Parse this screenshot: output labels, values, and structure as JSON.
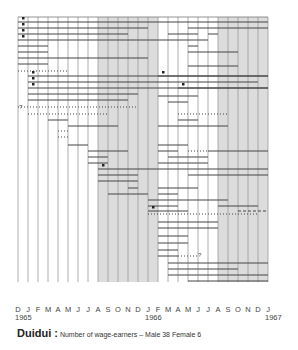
{
  "chart_data": {
    "type": "timeline",
    "title": "Duidui",
    "subtitle": "Number of wage-earners – Male 38   Female 6",
    "caption_name": "Duidui :",
    "caption_text": "Number of wage-earners – Male 38    Female 6",
    "x_ticks": [
      "D",
      "J",
      "F",
      "M",
      "A",
      "M",
      "J",
      "J",
      "A",
      "S",
      "O",
      "N",
      "D",
      "J",
      "F",
      "M",
      "A",
      "M",
      "J",
      "J",
      "A",
      "S",
      "O",
      "N",
      "D",
      "J"
    ],
    "year_labels": [
      {
        "label": "1965",
        "index": 0
      },
      {
        "label": "1966",
        "index": 13
      },
      {
        "label": "1967",
        "index": 25
      }
    ],
    "shaded_ranges": [
      [
        8,
        14
      ],
      [
        20,
        25
      ]
    ],
    "grid": {
      "x0": 18,
      "dx": 10,
      "top": 17,
      "bottom": 282
    },
    "rows": [
      {
        "y": 22,
        "start": 0,
        "end": 25,
        "style": "solid",
        "marker": "dot"
      },
      {
        "y": 28,
        "start": 0,
        "end": 13,
        "style": "solid",
        "marker": "dot"
      },
      {
        "y": 28,
        "start": 17,
        "end": 25,
        "style": "solid"
      },
      {
        "y": 34,
        "start": 0,
        "end": 11,
        "style": "solid",
        "marker": "dot"
      },
      {
        "y": 34,
        "start": 15,
        "end": 18,
        "style": "solid"
      },
      {
        "y": 34,
        "start": 19,
        "end": 20,
        "style": "solid"
      },
      {
        "y": 40,
        "start": 0,
        "end": 19,
        "style": "solid",
        "marker": "dot"
      },
      {
        "y": 46,
        "start": 0,
        "end": 3,
        "style": "solid"
      },
      {
        "y": 46,
        "start": 17,
        "end": 18,
        "style": "solid"
      },
      {
        "y": 52,
        "start": 0,
        "end": 3,
        "style": "solid"
      },
      {
        "y": 52,
        "start": 17,
        "end": 22,
        "style": "solid"
      },
      {
        "y": 58,
        "start": 0,
        "end": 13,
        "style": "solid"
      },
      {
        "y": 64,
        "start": 0,
        "end": 3,
        "style": "solid"
      },
      {
        "y": 66,
        "start": 17,
        "end": 22,
        "style": "solid"
      },
      {
        "y": 71,
        "start": 0,
        "end": 5,
        "style": "dotted"
      },
      {
        "y": 76,
        "start": 1,
        "end": 25,
        "style": "solid",
        "marker": "dot"
      },
      {
        "y": 76,
        "start": 14,
        "end": 25,
        "style": "solid",
        "marker": "dot"
      },
      {
        "y": 82,
        "start": 1,
        "end": 24,
        "style": "solid",
        "marker": "dot"
      },
      {
        "y": 88,
        "start": 1,
        "end": 25,
        "style": "solid",
        "marker": "dot"
      },
      {
        "y": 88,
        "start": 16,
        "end": 25,
        "style": "solid",
        "marker": "dot"
      },
      {
        "y": 94,
        "start": 1,
        "end": 12,
        "style": "solid"
      },
      {
        "y": 96,
        "start": 14,
        "end": 18,
        "style": "solid"
      },
      {
        "y": 100,
        "start": 1,
        "end": 11,
        "style": "solid"
      },
      {
        "y": 102,
        "start": 15,
        "end": 17,
        "style": "solid"
      },
      {
        "y": 107,
        "start": 0,
        "end": 12,
        "style": "dotted",
        "marker": "question"
      },
      {
        "y": 114,
        "start": 1,
        "end": 9,
        "style": "dotted"
      },
      {
        "y": 114,
        "start": 16,
        "end": 21,
        "style": "dotted"
      },
      {
        "y": 120,
        "start": 3,
        "end": 5,
        "style": "solid"
      },
      {
        "y": 120,
        "start": 16,
        "end": 18,
        "style": "solid"
      },
      {
        "y": 126,
        "start": 5,
        "end": 10,
        "style": "solid"
      },
      {
        "y": 126,
        "start": 14,
        "end": 21,
        "style": "solid"
      },
      {
        "y": 131,
        "start": 4,
        "end": 5,
        "style": "dotted"
      },
      {
        "y": 137,
        "start": 4,
        "end": 5,
        "style": "dotted"
      },
      {
        "y": 145,
        "start": 5,
        "end": 7,
        "style": "solid"
      },
      {
        "y": 145,
        "start": 14,
        "end": 17,
        "style": "solid"
      },
      {
        "y": 151,
        "start": 7,
        "end": 11,
        "style": "solid"
      },
      {
        "y": 151,
        "start": 14,
        "end": 16,
        "style": "solid"
      },
      {
        "y": 151,
        "start": 17,
        "end": 19,
        "style": "dotted"
      },
      {
        "y": 151,
        "start": 19,
        "end": 25,
        "style": "solid"
      },
      {
        "y": 157,
        "start": 7,
        "end": 9,
        "style": "solid"
      },
      {
        "y": 157,
        "start": 15,
        "end": 19,
        "style": "solid"
      },
      {
        "y": 163,
        "start": 7,
        "end": 9,
        "style": "solid"
      },
      {
        "y": 163,
        "start": 14,
        "end": 19,
        "style": "solid"
      },
      {
        "y": 169,
        "start": 8,
        "end": 25,
        "style": "solid",
        "marker": "dot"
      },
      {
        "y": 175,
        "start": 8,
        "end": 12,
        "style": "solid"
      },
      {
        "y": 175,
        "start": 17,
        "end": 25,
        "style": "solid"
      },
      {
        "y": 181,
        "start": 8,
        "end": 12,
        "style": "solid"
      },
      {
        "y": 188,
        "start": 11,
        "end": 12,
        "style": "solid"
      },
      {
        "y": 188,
        "start": 14,
        "end": 18,
        "style": "solid"
      },
      {
        "y": 194,
        "start": 9,
        "end": 13,
        "style": "solid"
      },
      {
        "y": 194,
        "start": 14,
        "end": 16,
        "style": "solid"
      },
      {
        "y": 200,
        "start": 13,
        "end": 14,
        "style": "solid"
      },
      {
        "y": 200,
        "start": 14,
        "end": 21,
        "style": "solid"
      },
      {
        "y": 206,
        "start": 13,
        "end": 16,
        "style": "solid"
      },
      {
        "y": 206,
        "start": 20,
        "end": 24,
        "style": "solid"
      },
      {
        "y": 211,
        "start": 13,
        "end": 17,
        "style": "solid",
        "marker": "dot"
      },
      {
        "y": 211,
        "start": 22,
        "end": 25,
        "style": "dashed"
      },
      {
        "y": 214,
        "start": 13,
        "end": 24,
        "style": "dotted"
      },
      {
        "y": 222,
        "start": 14,
        "end": 20,
        "style": "solid"
      },
      {
        "y": 228,
        "start": 14,
        "end": 20,
        "style": "solid"
      },
      {
        "y": 236,
        "start": 14,
        "end": 17,
        "style": "solid"
      },
      {
        "y": 243,
        "start": 14,
        "end": 17,
        "style": "solid"
      },
      {
        "y": 250,
        "start": 14,
        "end": 16,
        "style": "solid"
      },
      {
        "y": 256,
        "start": 14,
        "end": 16,
        "style": "solid"
      },
      {
        "y": 256,
        "start": 16,
        "end": 18,
        "style": "dotted",
        "marker": "question-end"
      },
      {
        "y": 263,
        "start": 15,
        "end": 25,
        "style": "solid"
      },
      {
        "y": 269,
        "start": 15,
        "end": 22,
        "style": "solid"
      },
      {
        "y": 275,
        "start": 15,
        "end": 22,
        "style": "solid"
      },
      {
        "y": 275,
        "start": 22,
        "end": 25,
        "style": "solid"
      },
      {
        "y": 281,
        "start": 17,
        "end": 25,
        "style": "solid"
      }
    ]
  }
}
